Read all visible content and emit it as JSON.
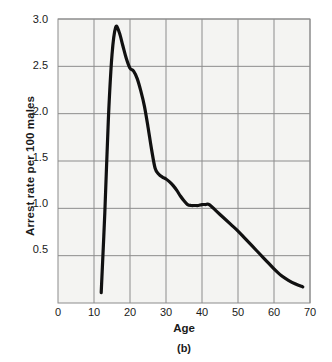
{
  "chart_data": {
    "type": "line",
    "title": "",
    "caption": "(b)",
    "xlabel": "Age",
    "ylabel": "Arrest rate per 100 males",
    "xlim": [
      0,
      70
    ],
    "ylim": [
      0,
      3.0
    ],
    "xticks": [
      "0",
      "10",
      "20",
      "30",
      "40",
      "50",
      "60",
      "70"
    ],
    "xtick_values": [
      0,
      10,
      20,
      30,
      40,
      50,
      60,
      70
    ],
    "yticks": [
      "0.5",
      "1.0",
      "1.5",
      "2.0",
      "2.5",
      "3.0"
    ],
    "ytick_values": [
      0.5,
      1.0,
      1.5,
      2.0,
      2.5,
      3.0
    ],
    "grid": true,
    "legend": "none",
    "series": [
      {
        "name": "Arrest rate per 100 males",
        "color": "#111111",
        "x": [
          12,
          13,
          14,
          15,
          16,
          17,
          18,
          19,
          20,
          21,
          22,
          23,
          24,
          25,
          26,
          27,
          28,
          29,
          30,
          31,
          32,
          33,
          34,
          35,
          36,
          37,
          38,
          39,
          40,
          41,
          42,
          44,
          46,
          48,
          50,
          52,
          54,
          56,
          58,
          60,
          62,
          64,
          66,
          68
        ],
        "y": [
          0.11,
          0.95,
          1.95,
          2.62,
          2.91,
          2.86,
          2.72,
          2.58,
          2.48,
          2.45,
          2.37,
          2.24,
          2.08,
          1.86,
          1.62,
          1.42,
          1.36,
          1.33,
          1.31,
          1.28,
          1.24,
          1.19,
          1.13,
          1.08,
          1.04,
          1.03,
          1.03,
          1.03,
          1.04,
          1.04,
          1.04,
          0.97,
          0.9,
          0.83,
          0.76,
          0.68,
          0.6,
          0.52,
          0.44,
          0.36,
          0.29,
          0.24,
          0.2,
          0.17
        ]
      }
    ],
    "annotations": {
      "peak_age": 16,
      "peak_value": 2.91,
      "plateau_range_age": [
        36,
        42
      ],
      "plateau_value": 1.04,
      "start_age": 12,
      "start_value": 0.11,
      "end_age": 68,
      "end_value": 0.17
    },
    "colors": {
      "line": "#111111",
      "grid": "#8c8c8c",
      "plot_background": "#f4f4f2",
      "axis": "#8c8c8c",
      "text": "#1a1a1a"
    }
  }
}
